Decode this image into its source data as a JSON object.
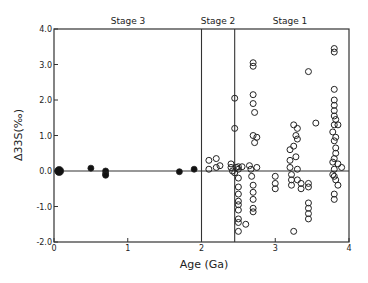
{
  "chart_data": {
    "type": "scatter",
    "title": "",
    "xlabel": "Age (Ga)",
    "ylabel": "Δ33S(‰)",
    "xlim": [
      0,
      4
    ],
    "ylim": [
      -2.0,
      4.0
    ],
    "xticks": [
      "0",
      "1",
      "2",
      "3",
      "4"
    ],
    "yticks": [
      "4.0",
      "3.0",
      "2.0",
      "1.0",
      "0.0",
      "-1.0",
      "-2.0"
    ],
    "grid": false,
    "reference_lines": {
      "horizontal_y": 0.0,
      "vertical_x": [
        2.0,
        2.45
      ]
    },
    "annotations": [
      {
        "text": "Stage 3",
        "x": 1.0
      },
      {
        "text": "Stage 2",
        "x": 2.22
      },
      {
        "text": "Stage 1",
        "x": 3.2
      }
    ],
    "series": [
      {
        "name": "filled",
        "marker": "filled-circle",
        "points": [
          [
            0.07,
            0.0
          ],
          [
            0.5,
            0.08
          ],
          [
            0.7,
            0.0
          ],
          [
            0.7,
            -0.08
          ],
          [
            0.7,
            -0.12
          ],
          [
            1.7,
            -0.02
          ],
          [
            1.9,
            0.05
          ]
        ]
      },
      {
        "name": "open",
        "marker": "open-circle",
        "points": [
          [
            2.1,
            0.3
          ],
          [
            2.1,
            0.05
          ],
          [
            2.2,
            0.35
          ],
          [
            2.2,
            0.1
          ],
          [
            2.25,
            0.15
          ],
          [
            2.4,
            0.2
          ],
          [
            2.4,
            0.1
          ],
          [
            2.42,
            0.0
          ],
          [
            2.45,
            2.05
          ],
          [
            2.45,
            1.2
          ],
          [
            2.45,
            -0.05
          ],
          [
            2.47,
            0.1
          ],
          [
            2.5,
            0.05
          ],
          [
            2.5,
            -0.2
          ],
          [
            2.5,
            -0.45
          ],
          [
            2.5,
            -0.65
          ],
          [
            2.5,
            -0.85
          ],
          [
            2.5,
            -0.95
          ],
          [
            2.5,
            -1.1
          ],
          [
            2.5,
            -1.35
          ],
          [
            2.5,
            -1.45
          ],
          [
            2.5,
            -1.7
          ],
          [
            2.5,
            0.12
          ],
          [
            2.55,
            0.12
          ],
          [
            2.6,
            -1.5
          ],
          [
            2.65,
            0.15
          ],
          [
            2.67,
            0.05
          ],
          [
            2.68,
            -0.15
          ],
          [
            2.7,
            -0.4
          ],
          [
            2.7,
            -0.6
          ],
          [
            2.7,
            -0.8
          ],
          [
            2.7,
            -1.05
          ],
          [
            2.7,
            -1.15
          ],
          [
            2.7,
            3.05
          ],
          [
            2.7,
            2.95
          ],
          [
            2.7,
            2.15
          ],
          [
            2.7,
            1.9
          ],
          [
            2.72,
            1.65
          ],
          [
            2.7,
            1.0
          ],
          [
            2.75,
            0.95
          ],
          [
            2.72,
            0.8
          ],
          [
            2.75,
            0.1
          ],
          [
            3.0,
            -0.15
          ],
          [
            3.0,
            -0.35
          ],
          [
            3.0,
            -0.5
          ],
          [
            3.2,
            0.6
          ],
          [
            3.2,
            0.3
          ],
          [
            3.2,
            0.1
          ],
          [
            3.22,
            -0.1
          ],
          [
            3.22,
            -0.25
          ],
          [
            3.22,
            -0.4
          ],
          [
            3.25,
            1.3
          ],
          [
            3.28,
            1.0
          ],
          [
            3.25,
            0.7
          ],
          [
            3.28,
            0.4
          ],
          [
            3.3,
            1.2
          ],
          [
            3.3,
            0.9
          ],
          [
            3.3,
            0.05
          ],
          [
            3.3,
            -0.25
          ],
          [
            3.25,
            -1.7
          ],
          [
            3.35,
            -0.35
          ],
          [
            3.35,
            -0.5
          ],
          [
            3.45,
            -0.35
          ],
          [
            3.45,
            -0.45
          ],
          [
            3.45,
            -0.9
          ],
          [
            3.45,
            -1.05
          ],
          [
            3.45,
            -1.2
          ],
          [
            3.45,
            -1.35
          ],
          [
            3.45,
            2.8
          ],
          [
            3.55,
            1.35
          ],
          [
            3.8,
            3.45
          ],
          [
            3.8,
            3.35
          ],
          [
            3.8,
            2.3
          ],
          [
            3.8,
            2.0
          ],
          [
            3.8,
            1.85
          ],
          [
            3.8,
            1.7
          ],
          [
            3.8,
            1.55
          ],
          [
            3.82,
            1.45
          ],
          [
            3.8,
            1.3
          ],
          [
            3.85,
            1.3
          ],
          [
            3.78,
            1.1
          ],
          [
            3.82,
            0.95
          ],
          [
            3.8,
            0.85
          ],
          [
            3.82,
            0.65
          ],
          [
            3.82,
            0.5
          ],
          [
            3.8,
            0.35
          ],
          [
            3.78,
            0.25
          ],
          [
            3.85,
            0.2
          ],
          [
            3.8,
            0.05
          ],
          [
            3.8,
            -0.15
          ],
          [
            3.82,
            -0.25
          ],
          [
            3.78,
            -0.1
          ],
          [
            3.85,
            -0.4
          ],
          [
            3.8,
            -0.65
          ],
          [
            3.8,
            -0.8
          ],
          [
            3.9,
            0.1
          ]
        ]
      }
    ]
  },
  "labels": {
    "stage1": "Stage 1",
    "stage2": "Stage 2",
    "stage3": "Stage 3",
    "xlabel": "Age (Ga)",
    "ylabel": "Δ33S(‰)"
  }
}
